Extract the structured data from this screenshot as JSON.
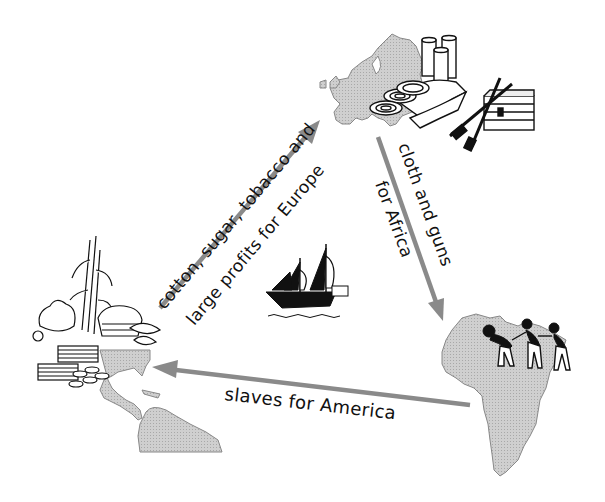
{
  "diagram": {
    "type": "triangular-trade",
    "nodes": [
      {
        "id": "europe",
        "region": "Europe",
        "illustration": [
          "cloth-rolls",
          "fabric",
          "muskets",
          "chest"
        ]
      },
      {
        "id": "africa",
        "region": "Africa",
        "illustration": [
          "enslaved-people-figures"
        ]
      },
      {
        "id": "america",
        "region": "America",
        "illustration": [
          "sugar-cane",
          "cotton",
          "tobacco-leaves",
          "basket",
          "money-stacks",
          "coins"
        ]
      }
    ],
    "arrows": [
      {
        "id": "america-to-europe",
        "from": "america",
        "to": "europe",
        "label_line1": "cotton, sugar, tobacco and",
        "label_line2": "large profits for Europe"
      },
      {
        "id": "europe-to-africa",
        "from": "europe",
        "to": "africa",
        "label_line1": "cloth and guns",
        "label_line2": "for Africa"
      },
      {
        "id": "africa-to-america",
        "from": "africa",
        "to": "america",
        "label_line1": "slaves for America"
      }
    ],
    "center_icon": "sailing-ship",
    "colors": {
      "land": "#c8c8c8",
      "arrow": "#8a8a8a",
      "ink": "#111111",
      "background": "#ffffff"
    }
  }
}
